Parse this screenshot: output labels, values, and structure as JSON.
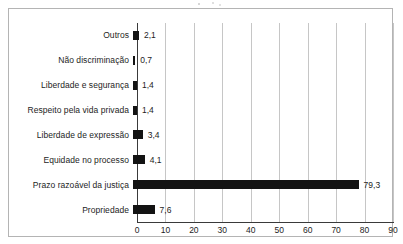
{
  "chart_data": {
    "type": "bar",
    "orientation": "horizontal",
    "title": "",
    "subtitle": "",
    "xlabel": "",
    "ylabel": "",
    "xlim": [
      0,
      90
    ],
    "xticks": [
      0,
      10,
      20,
      30,
      40,
      50,
      60,
      70,
      80,
      90
    ],
    "xtick_labels": [
      "0",
      "10",
      "20",
      "30",
      "40",
      "50",
      "60",
      "70",
      "80",
      "90"
    ],
    "grid": "vertical",
    "legend": "none",
    "bar_color": "#131313",
    "categories": [
      "Outros",
      "Não discriminação",
      "Liberdade e segurança",
      "Respeito pela vida privada",
      "Liberdade de expressão",
      "Equidade no processo",
      "Prazo razoável da justiça",
      "Propriedade"
    ],
    "values": [
      2.1,
      0.7,
      1.4,
      1.4,
      3.4,
      4.1,
      79.3,
      7.6
    ],
    "value_labels": [
      "2,1",
      "0,7",
      "1,4",
      "1,4",
      "3,4",
      "4,1",
      "79,3",
      "7,6"
    ]
  },
  "colors": {
    "bar": "#131313",
    "axis": "#3a3a3a",
    "gridline": "#c6c6c6",
    "frame_border": "#b4b4b4",
    "text": "#1d1d1d",
    "background": "#ffffff"
  }
}
